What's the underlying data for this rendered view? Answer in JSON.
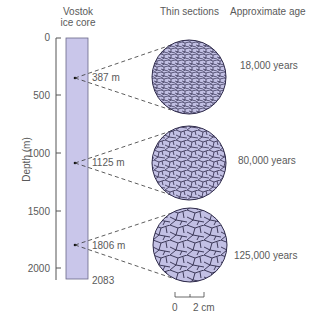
{
  "headers": {
    "core": [
      "Vostok",
      "ice core"
    ],
    "sections": "Thin sections",
    "age": "Approximate age"
  },
  "axis": {
    "label": "Depth (m)",
    "ticks": [
      "0",
      "500",
      "1000",
      "1500",
      "2000"
    ],
    "bottom_label": "2083"
  },
  "samples": [
    {
      "depth": "387 m",
      "age": "18,000 years",
      "grain": "small"
    },
    {
      "depth": "1125 m",
      "age": "80,000 years",
      "grain": "medium"
    },
    {
      "depth": "1806 m",
      "age": "125,000 years",
      "grain": "large"
    }
  ],
  "scale_bar": {
    "start": "0",
    "end": "2 cm"
  },
  "colors": {
    "core_fill": "#c9c6ea",
    "section_fill": "#c2c0e4",
    "grain_line": "#2e2a4a",
    "axis": "#555555"
  }
}
